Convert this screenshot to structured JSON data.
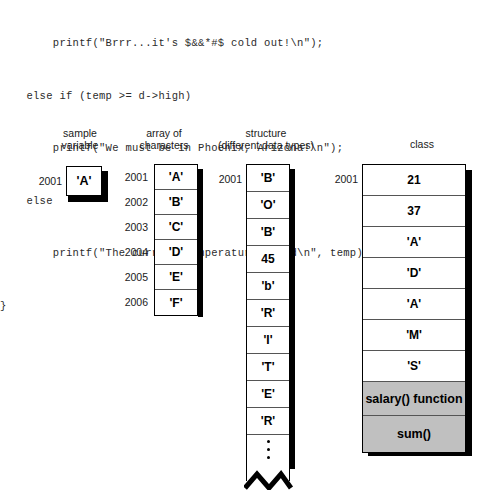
{
  "code": {
    "lines": [
      "        printf(\"Brrr...it's $&&*#$ cold out!\\n\");",
      "    else if (temp >= d->high)",
      "        printf(\"We must be in Phoenix, Arizona!\\n\");",
      "    else",
      "        printf(\"The current temperature is %d\\n\", temp);",
      "}"
    ]
  },
  "diagram": {
    "columns": [
      {
        "id": "sample-variable",
        "title": "sample\nvariable",
        "addresses": [
          "2001"
        ],
        "cells": [
          {
            "value": "'A'",
            "shaded": false
          }
        ]
      },
      {
        "id": "array-of-characters",
        "title": "array of\ncharacters",
        "addresses": [
          "2001",
          "2002",
          "2003",
          "2004",
          "2005",
          "2006"
        ],
        "cells": [
          {
            "value": "'A'",
            "shaded": false
          },
          {
            "value": "'B'",
            "shaded": false
          },
          {
            "value": "'C'",
            "shaded": false
          },
          {
            "value": "'D'",
            "shaded": false
          },
          {
            "value": "'E'",
            "shaded": false
          },
          {
            "value": "'F'",
            "shaded": false
          }
        ]
      },
      {
        "id": "structure",
        "title": "structure\n(different data types)",
        "addresses": [
          "2001"
        ],
        "cells": [
          {
            "value": "'B'",
            "shaded": false
          },
          {
            "value": "'O'",
            "shaded": false
          },
          {
            "value": "'B'",
            "shaded": false
          },
          {
            "value": "45",
            "shaded": false
          },
          {
            "value": "'b'",
            "shaded": false
          },
          {
            "value": "'R'",
            "shaded": false
          },
          {
            "value": "'I'",
            "shaded": false
          },
          {
            "value": "'T'",
            "shaded": false
          },
          {
            "value": "'E'",
            "shaded": false
          },
          {
            "value": "'R'",
            "shaded": false
          },
          {
            "value": "",
            "shaded": false
          }
        ],
        "truncated": true
      },
      {
        "id": "class",
        "title": "class",
        "addresses": [
          "2001"
        ],
        "cells": [
          {
            "value": "21",
            "shaded": false
          },
          {
            "value": "37",
            "shaded": false
          },
          {
            "value": "'A'",
            "shaded": false
          },
          {
            "value": "'D'",
            "shaded": false
          },
          {
            "value": "'A'",
            "shaded": false
          },
          {
            "value": "'M'",
            "shaded": false
          },
          {
            "value": "'S'",
            "shaded": false
          },
          {
            "value": "salary() function",
            "shaded": true
          },
          {
            "value": "sum()",
            "shaded": true
          }
        ]
      }
    ]
  },
  "colors": {
    "shaded_cell": "#c0c0c0",
    "cell_border": "#555555",
    "outline": "#000000",
    "background": "#ffffff",
    "code_text": "#2b2b2b"
  }
}
